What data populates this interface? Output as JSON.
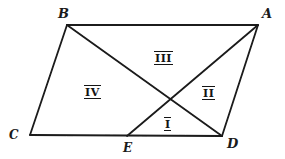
{
  "figure": {
    "type": "geometry-diagram",
    "background_color": "#ffffff",
    "stroke_color": "#1a1a1a",
    "stroke_width": 1.8,
    "canvas": {
      "width": 285,
      "height": 159
    },
    "vertices": [
      {
        "id": "B",
        "label": "B",
        "x": 67,
        "y": 25,
        "label_x": 58,
        "label_y": 8
      },
      {
        "id": "A",
        "label": "A",
        "x": 258,
        "y": 25,
        "label_x": 262,
        "label_y": 8
      },
      {
        "id": "C",
        "label": "C",
        "x": 30,
        "y": 135,
        "label_x": 9,
        "label_y": 130
      },
      {
        "id": "E",
        "label": "E",
        "x": 127,
        "y": 136,
        "label_x": 123,
        "label_y": 142
      },
      {
        "id": "D",
        "label": "D",
        "x": 222,
        "y": 136,
        "label_x": 227,
        "label_y": 138
      }
    ],
    "segments": [
      {
        "id": "BA",
        "from": "B",
        "to": "A",
        "name": "top-edge"
      },
      {
        "id": "BC",
        "from": "B",
        "to": "C",
        "name": "left-edge"
      },
      {
        "id": "CD",
        "from": "C",
        "to": "D",
        "name": "bottom-edge"
      },
      {
        "id": "AD",
        "from": "A",
        "to": "D",
        "name": "right-edge"
      },
      {
        "id": "BD",
        "from": "B",
        "to": "D",
        "name": "diagonal-b-d"
      },
      {
        "id": "EA",
        "from": "E",
        "to": "A",
        "name": "diagonal-e-a"
      }
    ],
    "intersection": {
      "id": "X",
      "x": 171,
      "y": 98
    },
    "regions": [
      {
        "id": "I",
        "label": "I",
        "x": 162,
        "y": 118
      },
      {
        "id": "II",
        "label": "II",
        "x": 201,
        "y": 87
      },
      {
        "id": "III",
        "label": "III",
        "x": 153,
        "y": 52
      },
      {
        "id": "IV",
        "label": "IV",
        "x": 83,
        "y": 86
      }
    ]
  }
}
